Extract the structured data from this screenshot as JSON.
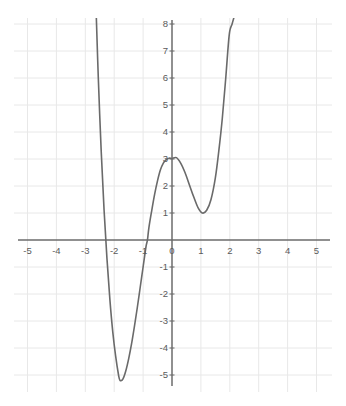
{
  "chart_data": {
    "type": "line",
    "title": "",
    "subtitle": "",
    "xlabel": "",
    "ylabel": "",
    "xlim": [
      -5.6,
      5.6
    ],
    "ylim": [
      -5.7,
      8.3
    ],
    "grid": true,
    "grid_color": "#e8e8e8",
    "axis_color": "#6b6b6b",
    "curve_color": "#6a6a6a",
    "background": "#ffffff",
    "legend": null,
    "legend_position": "none",
    "xticks": [
      -5,
      -4,
      -3,
      -2,
      -1,
      0,
      1,
      2,
      3,
      4,
      5
    ],
    "xtick_labels": [
      "-5",
      "-4",
      "-3",
      "-2",
      "-1",
      "0",
      "1",
      "2",
      "3",
      "4",
      "5"
    ],
    "yticks": [
      8,
      7,
      6,
      5,
      4,
      3,
      2,
      1,
      -1,
      -2,
      -3,
      -4,
      -5
    ],
    "ytick_labels": [
      "8",
      "7",
      "6",
      "5",
      "4",
      "3",
      "2",
      "1",
      "-1",
      "-2",
      "-3",
      "-4",
      "-5"
    ],
    "annotations": [],
    "series": [
      {
        "name": "quartic curve",
        "local_maximum": [
          0.15,
          3.05
        ],
        "local_minimum": [
          1.05,
          1.0
        ],
        "global_minimum": [
          -1.8,
          -5.2
        ],
        "x_intercepts": [
          -2.5,
          -0.85
        ],
        "y_intercept": 3.0,
        "left_branch_exit": [
          -2.62,
          8.3
        ],
        "right_branch_exit": [
          2.16,
          8.3
        ],
        "x": [
          -2.62,
          -2.55,
          -2.45,
          -2.35,
          -2.25,
          -2.15,
          -2.05,
          -1.95,
          -1.85,
          -1.8,
          -1.7,
          -1.6,
          -1.5,
          -1.4,
          -1.3,
          -1.2,
          -1.1,
          -1.0,
          -0.9,
          -0.85,
          -0.8,
          -0.7,
          -0.6,
          -0.5,
          -0.4,
          -0.3,
          -0.2,
          -0.1,
          0.0,
          0.15,
          0.3,
          0.45,
          0.6,
          0.75,
          0.9,
          1.05,
          1.2,
          1.35,
          1.5,
          1.62,
          1.74,
          1.86,
          1.98,
          2.08,
          2.16
        ],
        "y": [
          8.3,
          6.0,
          3.3,
          1.1,
          -0.7,
          -2.2,
          -3.4,
          -4.3,
          -5.0,
          -5.2,
          -5.15,
          -4.85,
          -4.4,
          -3.85,
          -3.2,
          -2.5,
          -1.75,
          -1.0,
          -0.25,
          0.0,
          0.45,
          1.1,
          1.7,
          2.2,
          2.6,
          2.85,
          2.98,
          3.03,
          3.02,
          3.05,
          2.85,
          2.5,
          2.05,
          1.6,
          1.2,
          1.0,
          1.1,
          1.5,
          2.3,
          3.3,
          4.5,
          6.0,
          7.6,
          8.0,
          8.3
        ]
      }
    ]
  },
  "axes": {
    "x_axis_name": "horizontal-axis",
    "y_axis_name": "vertical-axis"
  }
}
